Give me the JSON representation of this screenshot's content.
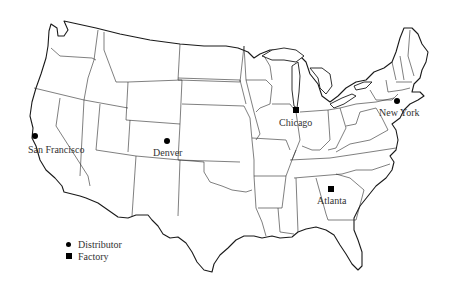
{
  "map": {
    "type": "outline map of the contiguous United States with state borders",
    "colors": {
      "line": "#1a1a1a",
      "marker": "#000000",
      "background": "#ffffff",
      "text": "#333333"
    }
  },
  "cities": [
    {
      "name": "San Francisco",
      "type": "distributor",
      "x": 35,
      "y": 136,
      "label_x": 28,
      "label_y": 145
    },
    {
      "name": "Denver",
      "type": "distributor",
      "x": 167,
      "y": 141,
      "label_x": 153,
      "label_y": 148
    },
    {
      "name": "Chicago",
      "type": "factory",
      "x": 296,
      "y": 111,
      "label_x": 279,
      "label_y": 118
    },
    {
      "name": "New York",
      "type": "distributor",
      "x": 397,
      "y": 101,
      "label_x": 379,
      "label_y": 108
    },
    {
      "name": "Atlanta",
      "type": "factory",
      "x": 331,
      "y": 189,
      "label_x": 317,
      "label_y": 196
    }
  ],
  "legend": {
    "items": [
      {
        "symbol": "circle",
        "label": "Distributor"
      },
      {
        "symbol": "square",
        "label": "Factory"
      }
    ]
  }
}
